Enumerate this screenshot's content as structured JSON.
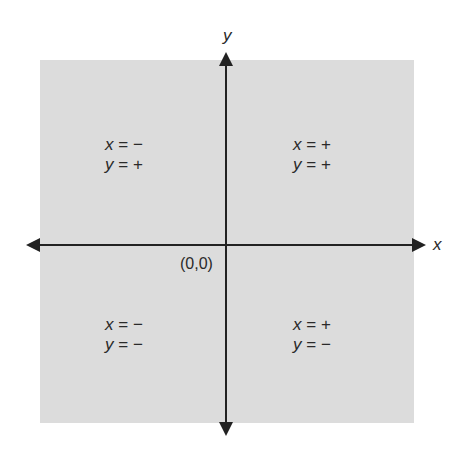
{
  "diagram": {
    "background_color": "#dcdcdc",
    "axis_color": "#222222",
    "axes": {
      "x_label": "x",
      "y_label": "y",
      "origin_label": "(0,0)"
    },
    "quadrants": [
      {
        "name": "top-left",
        "x_var": "x",
        "x_sign": "= −",
        "y_var": "y",
        "y_sign": "= +"
      },
      {
        "name": "top-right",
        "x_var": "x",
        "x_sign": "= +",
        "y_var": "y",
        "y_sign": "= +"
      },
      {
        "name": "bottom-left",
        "x_var": "x",
        "x_sign": "= −",
        "y_var": "y",
        "y_sign": "= −"
      },
      {
        "name": "bottom-right",
        "x_var": "x",
        "x_sign": "= +",
        "y_var": "y",
        "y_sign": "= −"
      }
    ]
  }
}
